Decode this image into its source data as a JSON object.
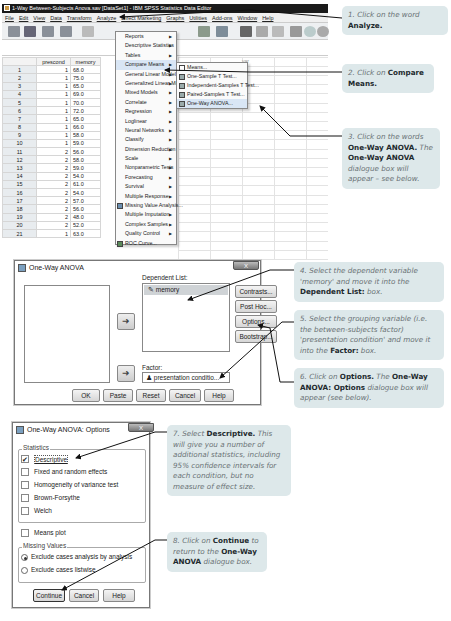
{
  "spss_window": {
    "title": "1-Way Between-Subjects Anova.sav [DataSet1] - IBM SPSS Statistics Data Editor",
    "menubar": [
      "File",
      "Edit",
      "View",
      "Data",
      "Transform",
      "Analyze",
      "Direct Marketing",
      "Graphs",
      "Utilities",
      "Add-ons",
      "Window",
      "Help"
    ],
    "grid": {
      "columns": [
        "prescond",
        "memory"
      ],
      "extra_column": "var",
      "rows": [
        {
          "n": "1",
          "prescond": "1",
          "memory": "68.0"
        },
        {
          "n": "2",
          "prescond": "1",
          "memory": "75.0"
        },
        {
          "n": "3",
          "prescond": "1",
          "memory": "65.0"
        },
        {
          "n": "4",
          "prescond": "1",
          "memory": "69.0"
        },
        {
          "n": "5",
          "prescond": "1",
          "memory": "70.0"
        },
        {
          "n": "6",
          "prescond": "1",
          "memory": "72.0"
        },
        {
          "n": "7",
          "prescond": "1",
          "memory": "65.0"
        },
        {
          "n": "8",
          "prescond": "1",
          "memory": "66.0"
        },
        {
          "n": "9",
          "prescond": "1",
          "memory": "58.0"
        },
        {
          "n": "10",
          "prescond": "1",
          "memory": "59.0"
        },
        {
          "n": "11",
          "prescond": "2",
          "memory": "56.0"
        },
        {
          "n": "12",
          "prescond": "2",
          "memory": "58.0"
        },
        {
          "n": "13",
          "prescond": "2",
          "memory": "59.0"
        },
        {
          "n": "14",
          "prescond": "2",
          "memory": "54.0"
        },
        {
          "n": "15",
          "prescond": "2",
          "memory": "61.0"
        },
        {
          "n": "16",
          "prescond": "2",
          "memory": "54.0"
        },
        {
          "n": "17",
          "prescond": "2",
          "memory": "57.0"
        },
        {
          "n": "18",
          "prescond": "2",
          "memory": "56.0"
        },
        {
          "n": "19",
          "prescond": "2",
          "memory": "48.0"
        },
        {
          "n": "20",
          "prescond": "2",
          "memory": "52.0"
        },
        {
          "n": "21",
          "prescond": "1",
          "memory": "63.0"
        }
      ]
    },
    "analyze_menu": [
      {
        "label": "Reports",
        "submenu": true
      },
      {
        "label": "Descriptive Statistics",
        "submenu": true
      },
      {
        "label": "Tables",
        "submenu": true
      },
      {
        "label": "Compare Means",
        "submenu": true,
        "highlighted": true
      },
      {
        "label": "General Linear Model",
        "submenu": true
      },
      {
        "label": "Generalized Linear Models",
        "submenu": true
      },
      {
        "label": "Mixed Models",
        "submenu": true
      },
      {
        "label": "Correlate",
        "submenu": true
      },
      {
        "label": "Regression",
        "submenu": true
      },
      {
        "label": "Loglinear",
        "submenu": true
      },
      {
        "label": "Neural Networks",
        "submenu": true
      },
      {
        "label": "Classify",
        "submenu": true
      },
      {
        "label": "Dimension Reduction",
        "submenu": true
      },
      {
        "label": "Scale",
        "submenu": true
      },
      {
        "label": "Nonparametric Tests",
        "submenu": true
      },
      {
        "label": "Forecasting",
        "submenu": true
      },
      {
        "label": "Survival",
        "submenu": true
      },
      {
        "label": "Multiple Response",
        "submenu": true
      },
      {
        "label": "Missing Value Analysis...",
        "submenu": false,
        "icon": true
      },
      {
        "label": "Multiple Imputation",
        "submenu": true
      },
      {
        "label": "Complex Samples",
        "submenu": true
      },
      {
        "label": "Quality Control",
        "submenu": true
      },
      {
        "label": "ROC Curve...",
        "submenu": false,
        "icon": true
      }
    ],
    "compare_means_submenu": [
      {
        "label": "Means..."
      },
      {
        "label": "One-Sample T Test..."
      },
      {
        "label": "Independent-Samples T Test..."
      },
      {
        "label": "Paired-Samples T Test..."
      },
      {
        "label": "One-Way ANOVA...",
        "highlighted": true
      }
    ]
  },
  "oneway_dialog": {
    "title": "One-Way ANOVA",
    "close": "X",
    "dependent_list_label": "Dependent List:",
    "dependent_item": "memory",
    "factor_label": "Factor:",
    "factor_value": "presentation conditio...",
    "side_buttons": [
      "Contrasts...",
      "Post Hoc...",
      "Options...",
      "Bootstrap..."
    ],
    "bottom_buttons": [
      "OK",
      "Paste",
      "Reset",
      "Cancel",
      "Help"
    ]
  },
  "options_dialog": {
    "title": "One-Way ANOVA: Options",
    "close": "X",
    "statistics_label": "Statistics",
    "statistics": [
      {
        "label": "Descriptive",
        "checked": true
      },
      {
        "label": "Fixed and random effects",
        "checked": false
      },
      {
        "label": "Homogeneity of variance test",
        "checked": false
      },
      {
        "label": "Brown-Forsythe",
        "checked": false
      },
      {
        "label": "Welch",
        "checked": false
      }
    ],
    "means_plot": "Means plot",
    "missing_label": "Missing Values",
    "missing_options": [
      {
        "label": "Exclude cases analysis by analysis",
        "selected": true
      },
      {
        "label": "Exclude cases listwise",
        "selected": false
      }
    ],
    "buttons": [
      "Continue",
      "Cancel",
      "Help"
    ]
  },
  "callouts": [
    {
      "pre": "1. Click on the word ",
      "bold": "Analyze.",
      "post": ""
    },
    {
      "pre": "2. Click on ",
      "bold": "Compare Means.",
      "post": ""
    },
    {
      "pre": "3. Click on the words ",
      "bold": "One-Way ANOVA.",
      "post": " The ",
      "bold2": "One-Way ANOVA",
      "post2": " dialogue box will appear – see below."
    },
    {
      "pre": "4. Select the dependent variable 'memory' and move it into the ",
      "bold": "Dependent List:",
      "post": " box."
    },
    {
      "pre": "5. Select the grouping variable (i.e. the between-subjects factor) 'presentation condition' and move it into the ",
      "bold": "Factor:",
      "post": " box."
    },
    {
      "pre": "6. Click on ",
      "bold": "Options.",
      "post": " The ",
      "bold2": "One-Way ANOVA: Options",
      "post2": " dialogue box will appear (see below)."
    },
    {
      "pre": "7. Select ",
      "bold": "Descriptive.",
      "post": " This will give you a number of additional statistics, including 95% confidence intervals for each condition, but no measure of effect size."
    },
    {
      "pre": "8. Click on ",
      "bold": "Continue",
      "post": " to return to the ",
      "bold2": "One-Way ANOVA",
      "post2": " dialogue box."
    }
  ]
}
